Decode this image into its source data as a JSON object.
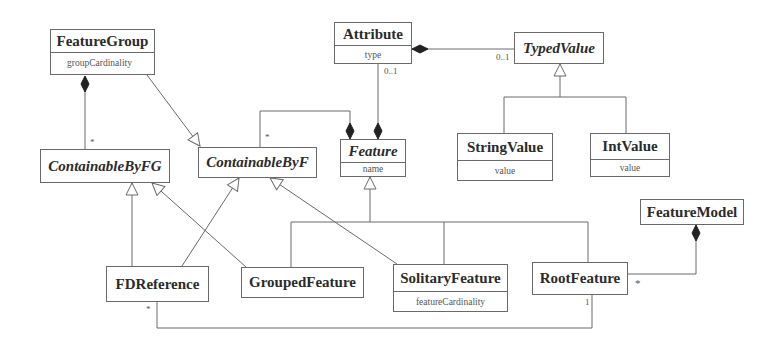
{
  "diagram": {
    "type": "UML class diagram",
    "classes": {
      "feature_group": {
        "name": "FeatureGroup",
        "attribute": "groupCardinality",
        "abstract": false
      },
      "attribute": {
        "name": "Attribute",
        "attribute": "type",
        "abstract": false
      },
      "typed_value": {
        "name": "TypedValue",
        "abstract": true
      },
      "containable_by_fg": {
        "name": "ContainableByFG",
        "abstract": true
      },
      "containable_by_f": {
        "name": "ContainableByF",
        "abstract": true
      },
      "feature": {
        "name": "Feature",
        "attribute": "name",
        "abstract": true
      },
      "string_value": {
        "name": "StringValue",
        "attribute": "value",
        "abstract": false
      },
      "int_value": {
        "name": "IntValue",
        "attribute": "value",
        "abstract": false
      },
      "feature_model": {
        "name": "FeatureModel",
        "abstract": false
      },
      "fd_reference": {
        "name": "FDReference",
        "abstract": false
      },
      "grouped_feature": {
        "name": "GroupedFeature",
        "abstract": false
      },
      "solitary_feature": {
        "name": "SolitaryFeature",
        "attribute": "featureCardinality",
        "abstract": false
      },
      "root_feature": {
        "name": "RootFeature",
        "abstract": false
      }
    },
    "multiplicities": {
      "fg_children": "*",
      "attribute_to_feature": "0..1",
      "attribute_to_typedvalue": "0..1",
      "feature_children": "*",
      "fdref_to_root": "*",
      "root_from_fdref": "1",
      "featuremodel_root": "*"
    },
    "relations": [
      {
        "kind": "composition",
        "from": "FeatureGroup",
        "to": "ContainableByFG",
        "multiplicity": "*"
      },
      {
        "kind": "generalization",
        "from": "FeatureGroup",
        "to": "ContainableByF"
      },
      {
        "kind": "composition",
        "from": "Attribute",
        "to": "TypedValue",
        "multiplicity": "0..1"
      },
      {
        "kind": "composition",
        "from": "Feature",
        "to": "Attribute",
        "multiplicity": "0..1"
      },
      {
        "kind": "composition",
        "from": "Feature",
        "to": "ContainableByF",
        "multiplicity": "*"
      },
      {
        "kind": "generalization",
        "from": "StringValue",
        "to": "TypedValue"
      },
      {
        "kind": "generalization",
        "from": "IntValue",
        "to": "TypedValue"
      },
      {
        "kind": "generalization",
        "from": "FDReference",
        "to": "ContainableByFG"
      },
      {
        "kind": "generalization",
        "from": "FDReference",
        "to": "ContainableByF"
      },
      {
        "kind": "generalization",
        "from": "GroupedFeature",
        "to": "ContainableByFG"
      },
      {
        "kind": "generalization",
        "from": "GroupedFeature",
        "to": "Feature"
      },
      {
        "kind": "generalization",
        "from": "SolitaryFeature",
        "to": "ContainableByF"
      },
      {
        "kind": "generalization",
        "from": "SolitaryFeature",
        "to": "Feature"
      },
      {
        "kind": "generalization",
        "from": "RootFeature",
        "to": "Feature"
      },
      {
        "kind": "composition",
        "from": "FeatureModel",
        "to": "RootFeature",
        "multiplicity": "*"
      },
      {
        "kind": "association",
        "from": "FDReference",
        "to": "RootFeature",
        "multiplicity_from": "*",
        "multiplicity_to": "1"
      }
    ],
    "colors": {
      "line": "#6a6a6a",
      "text": "#2b2b2b",
      "background": "#ffffff"
    }
  }
}
